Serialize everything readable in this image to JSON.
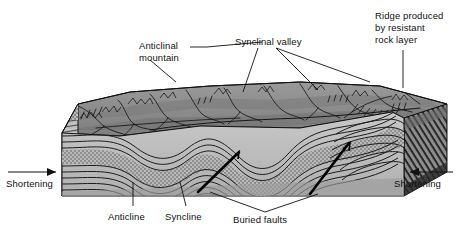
{
  "figure": {
    "background_color": "#ffffff",
    "line_color": "#111111",
    "terrain_color": "#8a8a8a",
    "strata_color": "#bdbdbd",
    "fault_color": "#000000"
  },
  "labels": {
    "anticlinal_mountain": "Anticlinal\nmountain",
    "anticlinal_mountain_line1": "Anticlinal",
    "anticlinal_mountain_line2": "mountain",
    "synclinal_valley": "Synclinal valley",
    "ridge_line1": "Ridge produced",
    "ridge_line2": "by resistant",
    "ridge_line3": "rock layer",
    "shortening_left": "Shortening",
    "shortening_right": "Shortening",
    "anticline": "Anticline",
    "syncline": "Syncline",
    "buried_faults": "Buried faults"
  },
  "features": [
    {
      "name": "anticlinal-mountain",
      "label": "Anticlinal mountain",
      "kind": "landform"
    },
    {
      "name": "synclinal-valley",
      "label": "Synclinal valley",
      "kind": "landform"
    },
    {
      "name": "resistant-ridge",
      "label": "Ridge produced by resistant rock layer",
      "kind": "landform"
    },
    {
      "name": "anticline",
      "label": "Anticline",
      "kind": "fold"
    },
    {
      "name": "syncline",
      "label": "Syncline",
      "kind": "fold"
    },
    {
      "name": "buried-faults",
      "label": "Buried faults",
      "kind": "fault"
    },
    {
      "name": "shortening-left",
      "label": "Shortening",
      "kind": "stress-arrow",
      "direction": "right"
    },
    {
      "name": "shortening-right",
      "label": "Shortening",
      "kind": "stress-arrow",
      "direction": "left"
    }
  ]
}
